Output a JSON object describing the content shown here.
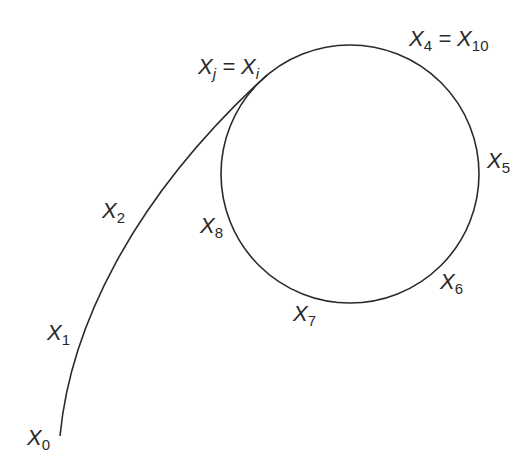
{
  "diagram": {
    "type": "rho-shaped sequence (tail entering a cycle)",
    "stroke_color": "#2a2a2a",
    "background": "#ffffff",
    "circle": {
      "cx": 350,
      "cy": 174,
      "r": 129
    },
    "labels": {
      "x0": {
        "base": "X",
        "sub": "0"
      },
      "x1": {
        "base": "X",
        "sub": "1"
      },
      "x2": {
        "base": "X",
        "sub": "2"
      },
      "xj_xi": {
        "base1": "X",
        "sub1": "j",
        "eq": " = ",
        "base2": "X",
        "sub2": "i"
      },
      "x4_x10": {
        "base1": "X",
        "sub1": "4",
        "eq": " = ",
        "base2": "X",
        "sub2": "10"
      },
      "x5": {
        "base": "X",
        "sub": "5"
      },
      "x6": {
        "base": "X",
        "sub": "6"
      },
      "x7": {
        "base": "X",
        "sub": "7"
      },
      "x8": {
        "base": "X",
        "sub": "8"
      }
    }
  }
}
